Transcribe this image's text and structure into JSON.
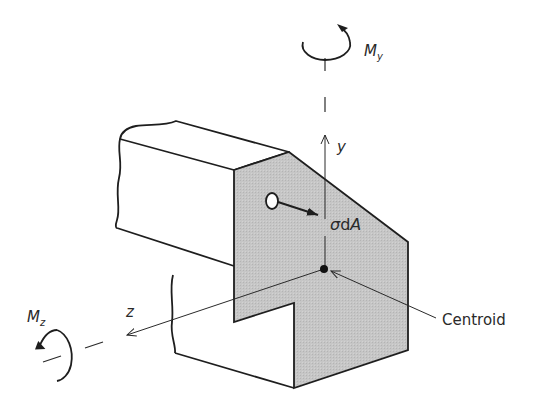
{
  "diagram": {
    "labels": {
      "my_symbol": "M",
      "my_sub": "y",
      "mz_symbol": "M",
      "mz_sub": "z",
      "y_axis": "y",
      "z_axis": "z",
      "stress_sigma": "σ",
      "stress_d": "d",
      "stress_A": "A",
      "centroid": "Centroid"
    },
    "colors": {
      "stroke": "#1e1e1e",
      "cut_face": "#c4c4c4",
      "background": "#ffffff",
      "text": "#2a2a2a"
    }
  }
}
